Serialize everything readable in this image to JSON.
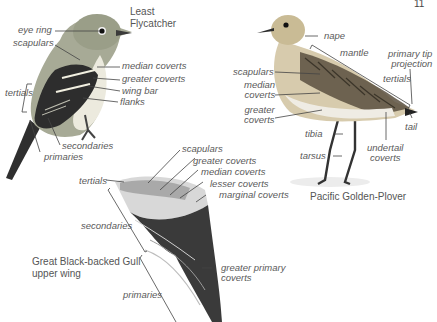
{
  "page_number": "11",
  "figures": {
    "flycatcher": {
      "title_line1": "Least",
      "title_line2": "Flycatcher",
      "labels": {
        "eye_ring": "eye ring",
        "scapulars": "scapulars",
        "median_coverts": "median coverts",
        "greater_coverts": "greater coverts",
        "wing_bar": "wing bar",
        "flanks": "flanks",
        "tertials": "tertials",
        "secondaries": "secondaries",
        "primaries": "primaries"
      }
    },
    "plover": {
      "title": "Pacific Golden-Plover",
      "labels": {
        "nape": "nape",
        "mantle": "mantle",
        "primary_tip_projection_1": "primary tip",
        "primary_tip_projection_2": "projection",
        "tertials": "tertials",
        "scapulars": "scapulars",
        "median_coverts_1": "median",
        "median_coverts_2": "coverts",
        "greater_coverts_1": "greater",
        "greater_coverts_2": "coverts",
        "tail": "tail",
        "tibia": "tibia",
        "tarsus": "tarsus",
        "undertail_coverts_1": "undertail",
        "undertail_coverts_2": "coverts"
      }
    },
    "gull_wing": {
      "title_line1": "Great Black-backed Gull",
      "title_line2": "upper wing",
      "labels": {
        "scapulars": "scapulars",
        "greater_coverts": "greater coverts",
        "median_coverts": "median coverts",
        "lesser_coverts": "lesser coverts",
        "marginal_coverts": "marginal coverts",
        "tertials": "tertials",
        "secondaries": "secondaries",
        "primaries": "primaries",
        "greater_primary_coverts_1": "greater primary",
        "greater_primary_coverts_2": "coverts"
      }
    }
  },
  "colors": {
    "leader_line": "#444444",
    "label_text": "#5a5a5a",
    "flycatcher_back": "#8a8f7a",
    "flycatcher_wing": "#2b2b2b",
    "plover_body": "#c9b88f",
    "gull_wing_dark": "#2a2a2a"
  }
}
